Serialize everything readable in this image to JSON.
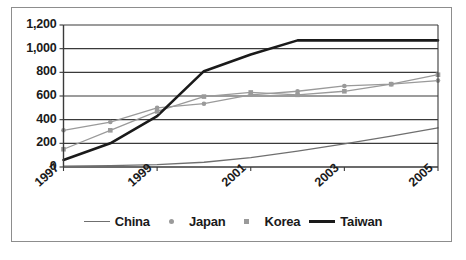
{
  "chart_data": {
    "type": "line",
    "title": "",
    "subtitle": "",
    "xlabel": "",
    "ylabel": "",
    "x": [
      1997,
      1998,
      1999,
      2000,
      2001,
      2002,
      2003,
      2004,
      2005
    ],
    "x_tick_labels": [
      "1997",
      "1999",
      "2001",
      "2003",
      "2005"
    ],
    "x_tick_values": [
      1997,
      1999,
      2001,
      2003,
      2005
    ],
    "y_tick_labels": [
      "0",
      "200",
      "400",
      "600",
      "800",
      "1,000",
      "1,200"
    ],
    "y_tick_values": [
      0,
      200,
      400,
      600,
      800,
      1000,
      1200
    ],
    "ylim": [
      0,
      1200
    ],
    "xlim": [
      1997,
      2005
    ],
    "grid": "horizontal",
    "legend_position": "bottom",
    "series": [
      {
        "name": "China",
        "color": "#6f6f6f",
        "marker": "none",
        "line": "thin",
        "values": [
          8,
          12,
          20,
          40,
          80,
          135,
          195,
          260,
          330
        ]
      },
      {
        "name": "Japan",
        "color": "#9a9a9a",
        "marker": "circle",
        "line": "thin",
        "values": [
          310,
          380,
          500,
          535,
          610,
          640,
          685,
          700,
          730
        ]
      },
      {
        "name": "Korea",
        "color": "#9a9a9a",
        "marker": "square",
        "line": "thin",
        "values": [
          150,
          310,
          470,
          595,
          630,
          610,
          640,
          700,
          780
        ]
      },
      {
        "name": "Taiwan",
        "color": "#1a1a1a",
        "marker": "none",
        "line": "thick",
        "values": [
          60,
          200,
          430,
          810,
          950,
          1070,
          1070,
          1070,
          1070
        ]
      }
    ]
  },
  "legend": {
    "items": [
      {
        "label": "China",
        "swatch": "line-thin"
      },
      {
        "label": "Japan",
        "swatch": "dot"
      },
      {
        "label": "Korea",
        "swatch": "square"
      },
      {
        "label": "Taiwan",
        "swatch": "line-thick"
      }
    ]
  }
}
